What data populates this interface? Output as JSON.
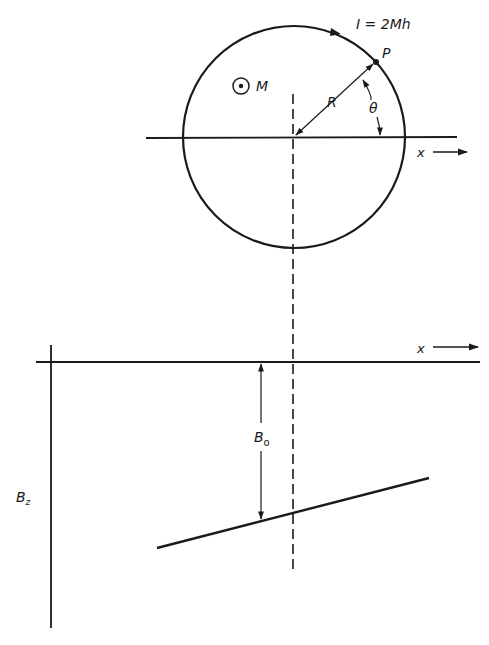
{
  "figure": {
    "top_panel": {
      "current_label": "I = 2Mh",
      "point_label": "P",
      "radius_label": "R",
      "angle_label": "θ",
      "moment_label": "M",
      "axis_label": "x",
      "moment_symbol": "dot-in-circle (out of page)"
    },
    "bottom_panel": {
      "axis_label": "x",
      "vertical_axis_label": "B",
      "vertical_axis_subscript": "z",
      "offset_label": "B",
      "offset_subscript": "o"
    }
  },
  "colors": {
    "ink": "#1a1a1a",
    "background": "#ffffff"
  }
}
